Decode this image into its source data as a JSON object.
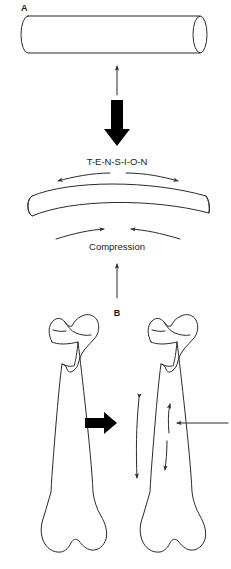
{
  "figure": {
    "background_color": "#ffffff",
    "line_color": "#2b2b2b",
    "fill_color": "#ffffff",
    "solid_arrow_color": "#000000",
    "width": 231,
    "height": 569
  },
  "panels": [
    {
      "id": "A",
      "label": "A",
      "description": "Straight cylinder deformed by load into a bent cylinder showing tension and compression"
    },
    {
      "id": "B",
      "label": "B",
      "description": "Femur at rest and femur under lateral load showing tension and compression sides"
    }
  ],
  "labels": {
    "panel_a": "A",
    "panel_b": "B",
    "tension": "T-E-N-S-I-O-N",
    "compression": "Compression"
  },
  "shapes": {
    "straight_cylinder": {
      "name": "straight-cylinder",
      "left_x": 21,
      "right_x": 207,
      "top_y": 16,
      "bottom_y": 53,
      "cap_radius_x": 7
    },
    "bent_cylinder": {
      "name": "bent-cylinder",
      "left_x": 25,
      "right_x": 211,
      "arch_peak_y": 186,
      "cap_radius_x": 7
    },
    "femur_left": {
      "name": "femur-unloaded",
      "center_x": 66,
      "top_y": 312,
      "bottom_y": 558
    },
    "femur_right": {
      "name": "femur-loaded",
      "center_x": 165,
      "top_y": 312,
      "bottom_y": 558
    }
  },
  "arrows": {
    "thin_up_a": {
      "name": "thin-up-arrow-cylinder",
      "x": 117,
      "from_y": 95,
      "to_y": 64,
      "direction": "up",
      "style": "thin"
    },
    "thick_down_a": {
      "name": "thick-down-arrow-load",
      "x": 117,
      "from_y": 100,
      "to_y": 145,
      "direction": "down",
      "style": "solid-block"
    },
    "tension_left": {
      "name": "tension-arrow-left",
      "direction": "left",
      "style": "curved"
    },
    "tension_right": {
      "name": "tension-arrow-right",
      "direction": "right",
      "style": "curved"
    },
    "compression_left": {
      "name": "compression-arrow-left",
      "direction": "right",
      "style": "curved"
    },
    "compression_right": {
      "name": "compression-arrow-right",
      "direction": "left",
      "style": "curved"
    },
    "thin_up_b": {
      "name": "thin-up-arrow-femur",
      "x": 117,
      "from_y": 298,
      "to_y": 262,
      "direction": "up",
      "style": "thin"
    },
    "thick_right_b": {
      "name": "thick-right-arrow-load",
      "from_x": 85,
      "to_x": 113,
      "y": 423,
      "direction": "right",
      "style": "solid-block"
    },
    "femur_tension": {
      "name": "femur-tension-arrow",
      "direction": "both",
      "style": "curved-double"
    },
    "femur_compression_up": {
      "name": "femur-compression-arrow-up",
      "direction": "up",
      "style": "curved"
    },
    "femur_compression_down": {
      "name": "femur-compression-arrow-down",
      "direction": "down",
      "style": "curved"
    },
    "lateral_force": {
      "name": "lateral-force-arrow",
      "from_x": 228,
      "to_x": 175,
      "y": 423,
      "direction": "left",
      "style": "thin"
    }
  }
}
